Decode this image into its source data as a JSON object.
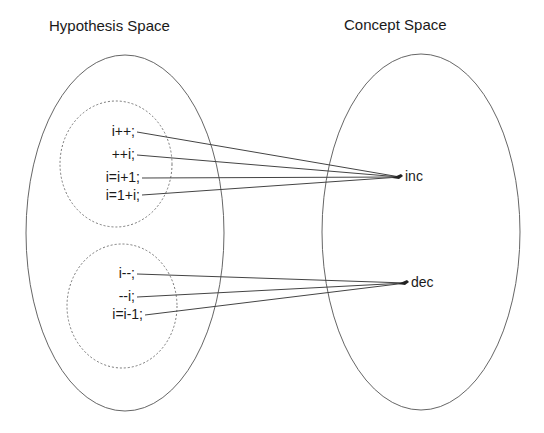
{
  "titles": {
    "hypothesis": "Hypothesis Space",
    "concept": "Concept Space"
  },
  "hypothesis_groups": [
    {
      "name": "increment-group",
      "items": [
        "i++;",
        "++i;",
        "i=i+1;",
        "i=1+i;"
      ]
    },
    {
      "name": "decrement-group",
      "items": [
        "i--;",
        "--i;",
        "i=i-1;"
      ]
    }
  ],
  "concepts": {
    "inc": "inc",
    "dec": "dec"
  },
  "colors": {
    "stroke": "#555555",
    "text": "#1a1a1a",
    "background": "#ffffff"
  }
}
